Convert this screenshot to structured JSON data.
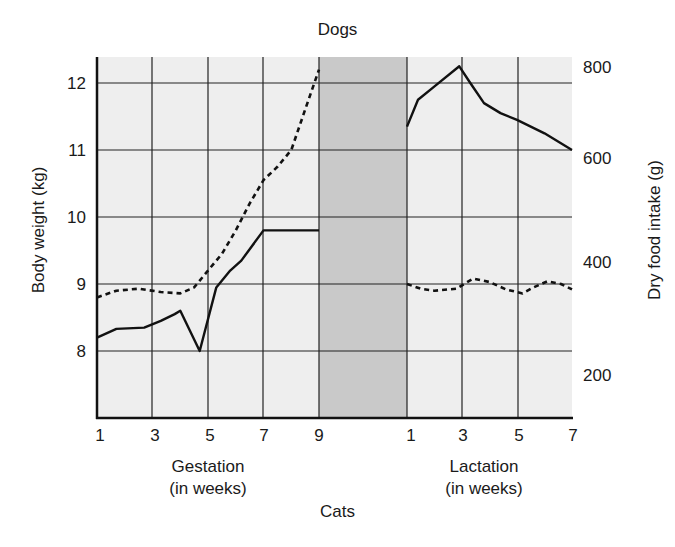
{
  "chart_data": {
    "type": "line",
    "title": "Dogs",
    "subtitle_bottom": "Cats",
    "ylabel": "Body weight (kg)",
    "ylabel_right": "Dry food intake (g)",
    "panels": [
      {
        "name": "Gestation",
        "xlabel": "Gestation (in weeks)",
        "xlabel_line1": "Gestation",
        "xlabel_line2": "(in weeks)",
        "x_ticks": [
          1,
          3,
          5,
          7,
          9
        ],
        "x_range": [
          1,
          9
        ]
      },
      {
        "name": "Lactation",
        "xlabel": "Lactation (in weeks)",
        "xlabel_line1": "Lactation",
        "xlabel_line2": "(in weeks)",
        "x_ticks": [
          1,
          3,
          5,
          7
        ],
        "x_range": [
          1,
          7
        ]
      }
    ],
    "y_ticks": [
      8,
      9,
      10,
      11,
      12
    ],
    "ylim": [
      7,
      12.4
    ],
    "y_right_ticks": [
      200,
      400,
      600,
      800
    ],
    "y_right_lim": [
      100,
      830
    ],
    "grid": true,
    "shaded_gap": "between gestation week 9 and lactation week 1",
    "series": [
      {
        "name": "Body weight (kg)",
        "style": "solid",
        "axis": "left",
        "gestation": {
          "x": [
            1,
            1.7,
            2.7,
            3.3,
            3.8,
            4.0,
            4.7,
            5.3,
            5.8,
            6.2,
            7.0,
            9.0
          ],
          "y": [
            8.2,
            8.33,
            8.35,
            8.45,
            8.55,
            8.6,
            8.0,
            8.95,
            9.2,
            9.35,
            9.8,
            9.8
          ]
        },
        "lactation": {
          "x": [
            1.0,
            1.4,
            2.0,
            2.9,
            3.3,
            3.8,
            4.4,
            5.0,
            6.0,
            7.0
          ],
          "y": [
            11.35,
            11.75,
            11.95,
            12.25,
            12.0,
            11.7,
            11.55,
            11.45,
            11.25,
            11.0
          ]
        }
      },
      {
        "name": "Dry food intake (g)",
        "style": "dashed",
        "axis": "right",
        "gestation": {
          "x": [
            1,
            1.7,
            2.5,
            3.3,
            4.0,
            4.5,
            5.0,
            5.5,
            6.0,
            6.5,
            7.0,
            7.5,
            8.0,
            8.5,
            9.0
          ],
          "y": [
            8.8,
            8.9,
            8.93,
            8.88,
            8.86,
            8.95,
            9.2,
            9.45,
            9.8,
            10.2,
            10.55,
            10.75,
            11.0,
            11.6,
            12.2
          ]
        },
        "lactation": {
          "x": [
            1.0,
            1.5,
            2.0,
            2.8,
            3.4,
            4.0,
            4.6,
            5.2,
            5.6,
            6.1,
            6.6,
            7.0
          ],
          "y": [
            9.0,
            8.93,
            8.9,
            8.93,
            9.08,
            9.03,
            8.92,
            8.86,
            8.95,
            9.04,
            9.0,
            8.92
          ]
        },
        "note": "y values expressed on body-weight axis coordinates; approx. 360-420 g lactation, rising to ~800 g late gestation"
      }
    ]
  },
  "labels": {
    "title_top": "Dogs",
    "title_bottom": "Cats",
    "ylabel_left": "Body weight (kg)",
    "ylabel_right": "Dry food intake (g)",
    "gestation_line1": "Gestation",
    "gestation_line2": "(in weeks)",
    "lactation_line1": "Lactation",
    "lactation_line2": "(in weeks)",
    "y_left": [
      "12",
      "11",
      "10",
      "9",
      "8"
    ],
    "y_right": [
      "800",
      "600",
      "400",
      "200"
    ],
    "x_gestation": [
      "1",
      "3",
      "5",
      "7",
      "9"
    ],
    "x_lactation": [
      "1",
      "3",
      "5",
      "7"
    ]
  },
  "colors": {
    "plot_bg": "#eeeeee",
    "shaded_bg": "#c9c9c9",
    "line": "#111111"
  }
}
